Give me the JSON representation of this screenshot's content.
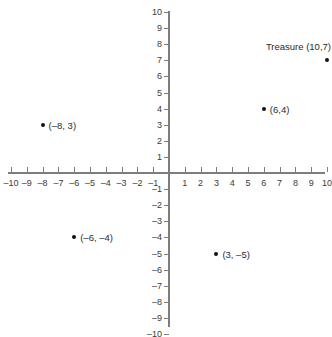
{
  "chart_data": {
    "type": "scatter",
    "title": "",
    "xlabel": "",
    "ylabel": "",
    "xlim": [
      -10,
      10
    ],
    "ylim": [
      -10,
      10
    ],
    "grid": false,
    "legend": "none",
    "x_ticks": [
      "–10",
      "–9",
      "–8",
      "–7",
      "–6",
      "–5",
      "–4",
      "–3",
      "–2",
      "–1",
      "1",
      "2",
      "3",
      "4",
      "5",
      "6",
      "7",
      "8",
      "9",
      "10"
    ],
    "x_tick_values": [
      -10,
      -9,
      -8,
      -7,
      -6,
      -5,
      -4,
      -3,
      -2,
      -1,
      1,
      2,
      3,
      4,
      5,
      6,
      7,
      8,
      9,
      10
    ],
    "y_ticks": [
      "10",
      "9",
      "8",
      "7",
      "6",
      "5",
      "4",
      "3",
      "2",
      "1",
      "–1",
      "–2",
      "–3",
      "–4",
      "–5",
      "–6",
      "–7",
      "–8",
      "–9",
      "–10"
    ],
    "y_tick_values": [
      10,
      9,
      8,
      7,
      6,
      5,
      4,
      3,
      2,
      1,
      -1,
      -2,
      -3,
      -4,
      -5,
      -6,
      -7,
      -8,
      -9,
      -10
    ],
    "points": [
      {
        "x": 10,
        "y": 7,
        "label": "Treasure (10,7)",
        "label_position": "above-left"
      },
      {
        "x": 6,
        "y": 4,
        "label": "(6,4)",
        "label_position": "right"
      },
      {
        "x": -8,
        "y": 3,
        "label": "(–8, 3)",
        "label_position": "right"
      },
      {
        "x": -6,
        "y": -4,
        "label": "(–6, –4)",
        "label_position": "right"
      },
      {
        "x": 3,
        "y": -5,
        "label": "(3, –5)",
        "label_position": "right"
      }
    ],
    "axis_color": "#7d7d7d",
    "point_color": "#111111",
    "text_color": "#2b2b2b"
  }
}
